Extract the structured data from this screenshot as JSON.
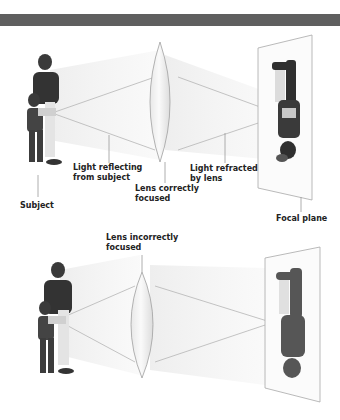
{
  "header_bar": {
    "color": "#5f5f5f"
  },
  "panels": [
    {
      "name": "correct-focus",
      "labels": {
        "light_reflecting": [
          "Light reflecting",
          "from subject"
        ],
        "lens": [
          "Lens correctly",
          "focused"
        ],
        "light_refracted": [
          "Light refracted",
          "by lens"
        ],
        "subject": "Subject",
        "focal_plane": "Focal plane"
      }
    },
    {
      "name": "incorrect-focus",
      "labels": {
        "lens": [
          "Lens incorrectly",
          "focused"
        ]
      }
    }
  ],
  "colors": {
    "ray": "#b5b5b5",
    "lens_edge": "#a0a0a0",
    "figure_dark": "#3a3a3a",
    "label": "#222222"
  }
}
